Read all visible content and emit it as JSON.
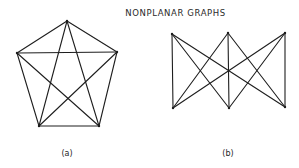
{
  "title": "NONPLANAR GRAPHS",
  "graphs": [
    {
      "id": "a",
      "label": "(a)",
      "name": "K5",
      "label_pos": [
        67,
        149
      ],
      "vertices": [
        [
          67,
          21
        ],
        [
          17,
          53
        ],
        [
          117,
          52
        ],
        [
          39,
          126
        ],
        [
          99,
          126
        ]
      ],
      "edges": [
        [
          0,
          1
        ],
        [
          0,
          2
        ],
        [
          0,
          3
        ],
        [
          0,
          4
        ],
        [
          1,
          2
        ],
        [
          1,
          3
        ],
        [
          1,
          4
        ],
        [
          2,
          3
        ],
        [
          2,
          4
        ],
        [
          3,
          4
        ]
      ]
    },
    {
      "id": "b",
      "label": "(b)",
      "name": "K3,3",
      "label_pos": [
        228,
        149
      ],
      "vertices": [
        [
          172,
          34
        ],
        [
          228,
          33
        ],
        [
          285,
          33
        ],
        [
          173,
          108
        ],
        [
          229,
          108
        ],
        [
          285,
          107
        ]
      ],
      "edges": [
        [
          0,
          3
        ],
        [
          0,
          4
        ],
        [
          0,
          5
        ],
        [
          1,
          3
        ],
        [
          1,
          4
        ],
        [
          1,
          5
        ],
        [
          2,
          3
        ],
        [
          2,
          4
        ],
        [
          2,
          5
        ]
      ]
    }
  ],
  "colors": {
    "stroke": "#1e1e1e",
    "background": "#ffffff"
  }
}
